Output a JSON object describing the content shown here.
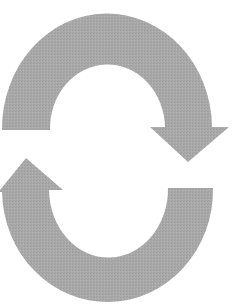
{
  "image": {
    "description": "Two curved arrows forming a cycle",
    "icon": "cycle-arrows-icon",
    "colors": {
      "background": "#ffffff",
      "arrow_fill": "#a9a9a9"
    },
    "arrows": [
      {
        "name": "top-arrow",
        "direction": "clockwise, pointing down on right"
      },
      {
        "name": "bottom-arrow",
        "direction": "clockwise, pointing up on left"
      }
    ]
  }
}
